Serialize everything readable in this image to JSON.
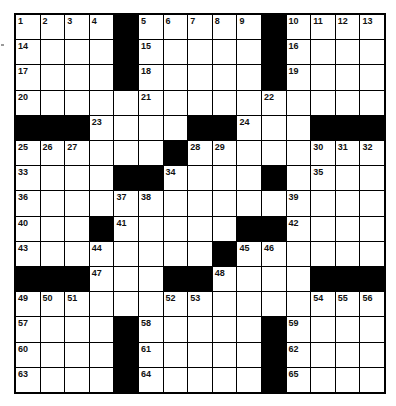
{
  "puzzle": {
    "size": 15,
    "colors": {
      "black": "#000000",
      "white": "#ffffff",
      "number": "#111111"
    },
    "layout": [
      "....#.....#....",
      "....#.....#....",
      "....#.....#....",
      "...............",
      "###....##...###",
      "......#........",
      "....##....#....",
      "...............",
      "...#.....##....",
      "........#......",
      "###...##....###",
      "...............",
      "....#.....#....",
      "....#.....#....",
      "....#.....#...."
    ],
    "numbers": [
      {
        "r": 0,
        "c": 0,
        "n": "1"
      },
      {
        "r": 0,
        "c": 1,
        "n": "2"
      },
      {
        "r": 0,
        "c": 2,
        "n": "3"
      },
      {
        "r": 0,
        "c": 3,
        "n": "4"
      },
      {
        "r": 0,
        "c": 5,
        "n": "5"
      },
      {
        "r": 0,
        "c": 6,
        "n": "6"
      },
      {
        "r": 0,
        "c": 7,
        "n": "7"
      },
      {
        "r": 0,
        "c": 8,
        "n": "8"
      },
      {
        "r": 0,
        "c": 9,
        "n": "9"
      },
      {
        "r": 0,
        "c": 11,
        "n": "10"
      },
      {
        "r": 0,
        "c": 12,
        "n": "11"
      },
      {
        "r": 0,
        "c": 13,
        "n": "12"
      },
      {
        "r": 0,
        "c": 14,
        "n": "13"
      },
      {
        "r": 1,
        "c": 0,
        "n": "14"
      },
      {
        "r": 1,
        "c": 5,
        "n": "15"
      },
      {
        "r": 1,
        "c": 11,
        "n": "16"
      },
      {
        "r": 2,
        "c": 0,
        "n": "17"
      },
      {
        "r": 2,
        "c": 5,
        "n": "18"
      },
      {
        "r": 2,
        "c": 11,
        "n": "19"
      },
      {
        "r": 3,
        "c": 0,
        "n": "20"
      },
      {
        "r": 3,
        "c": 5,
        "n": "21"
      },
      {
        "r": 3,
        "c": 10,
        "n": "22"
      },
      {
        "r": 4,
        "c": 3,
        "n": "23"
      },
      {
        "r": 4,
        "c": 9,
        "n": "24"
      },
      {
        "r": 5,
        "c": 0,
        "n": "25"
      },
      {
        "r": 5,
        "c": 1,
        "n": "26"
      },
      {
        "r": 5,
        "c": 2,
        "n": "27"
      },
      {
        "r": 5,
        "c": 7,
        "n": "28"
      },
      {
        "r": 5,
        "c": 8,
        "n": "29"
      },
      {
        "r": 5,
        "c": 12,
        "n": "30"
      },
      {
        "r": 5,
        "c": 13,
        "n": "31"
      },
      {
        "r": 5,
        "c": 14,
        "n": "32"
      },
      {
        "r": 6,
        "c": 0,
        "n": "33"
      },
      {
        "r": 6,
        "c": 6,
        "n": "34"
      },
      {
        "r": 6,
        "c": 12,
        "n": "35"
      },
      {
        "r": 7,
        "c": 0,
        "n": "36"
      },
      {
        "r": 7,
        "c": 4,
        "n": "37"
      },
      {
        "r": 7,
        "c": 5,
        "n": "38"
      },
      {
        "r": 7,
        "c": 11,
        "n": "39"
      },
      {
        "r": 8,
        "c": 0,
        "n": "40"
      },
      {
        "r": 8,
        "c": 4,
        "n": "41"
      },
      {
        "r": 8,
        "c": 11,
        "n": "42"
      },
      {
        "r": 9,
        "c": 0,
        "n": "43"
      },
      {
        "r": 9,
        "c": 3,
        "n": "44"
      },
      {
        "r": 9,
        "c": 9,
        "n": "45"
      },
      {
        "r": 9,
        "c": 10,
        "n": "46"
      },
      {
        "r": 10,
        "c": 3,
        "n": "47"
      },
      {
        "r": 10,
        "c": 8,
        "n": "48"
      },
      {
        "r": 11,
        "c": 0,
        "n": "49"
      },
      {
        "r": 11,
        "c": 1,
        "n": "50"
      },
      {
        "r": 11,
        "c": 2,
        "n": "51"
      },
      {
        "r": 11,
        "c": 6,
        "n": "52"
      },
      {
        "r": 11,
        "c": 7,
        "n": "53"
      },
      {
        "r": 11,
        "c": 12,
        "n": "54"
      },
      {
        "r": 11,
        "c": 13,
        "n": "55"
      },
      {
        "r": 11,
        "c": 14,
        "n": "56"
      },
      {
        "r": 12,
        "c": 0,
        "n": "57"
      },
      {
        "r": 12,
        "c": 5,
        "n": "58"
      },
      {
        "r": 12,
        "c": 11,
        "n": "59"
      },
      {
        "r": 13,
        "c": 0,
        "n": "60"
      },
      {
        "r": 13,
        "c": 5,
        "n": "61"
      },
      {
        "r": 13,
        "c": 11,
        "n": "62"
      },
      {
        "r": 14,
        "c": 0,
        "n": "63"
      },
      {
        "r": 14,
        "c": 5,
        "n": "64"
      },
      {
        "r": 14,
        "c": 11,
        "n": "65"
      }
    ]
  }
}
